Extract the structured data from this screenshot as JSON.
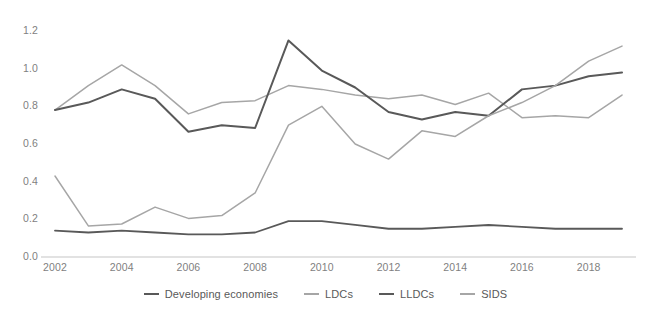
{
  "chart_data": {
    "type": "line",
    "title": "",
    "subtitle": "",
    "xlabel": "",
    "ylabel": "",
    "grid": false,
    "legend_position": "bottom",
    "xlim": [
      2002,
      2019
    ],
    "ylim": [
      0.0,
      1.2
    ],
    "y_ticks": [
      "0.0",
      "0.2",
      "0.4",
      "0.6",
      "0.8",
      "1.0",
      "1.2"
    ],
    "y_tick_values": [
      0.0,
      0.2,
      0.4,
      0.6,
      0.8,
      1.0,
      1.2
    ],
    "x_ticks": [
      "2002",
      "2004",
      "2006",
      "2008",
      "2010",
      "2012",
      "2014",
      "2016",
      "2018"
    ],
    "x_tick_values": [
      2002,
      2004,
      2006,
      2008,
      2010,
      2012,
      2014,
      2016,
      2018
    ],
    "x": [
      2002,
      2003,
      2004,
      2005,
      2006,
      2007,
      2008,
      2009,
      2010,
      2011,
      2012,
      2013,
      2014,
      2015,
      2016,
      2017,
      2018,
      2019
    ],
    "series": [
      {
        "name": "Developing economies",
        "color": "#595959",
        "width": 1.8,
        "values": [
          0.14,
          0.13,
          0.14,
          0.13,
          0.12,
          0.12,
          0.13,
          0.19,
          0.19,
          0.17,
          0.15,
          0.15,
          0.16,
          0.17,
          0.16,
          0.15,
          0.15,
          0.15
        ]
      },
      {
        "name": "LDCs",
        "color": "#a6a6a6",
        "width": 1.5,
        "values": [
          0.78,
          0.91,
          1.02,
          0.91,
          0.76,
          0.82,
          0.83,
          0.91,
          0.89,
          0.86,
          0.84,
          0.86,
          0.81,
          0.87,
          0.74,
          0.75,
          0.74,
          0.86
        ]
      },
      {
        "name": "LLDCs",
        "color": "#595959",
        "width": 2.0,
        "values": [
          0.78,
          0.82,
          0.89,
          0.84,
          0.665,
          0.7,
          0.685,
          1.15,
          0.99,
          0.9,
          0.77,
          0.73,
          0.77,
          0.75,
          0.89,
          0.91,
          0.96,
          0.98
        ]
      },
      {
        "name": "SIDS",
        "color": "#a6a6a6",
        "width": 1.5,
        "values": [
          0.43,
          0.165,
          0.175,
          0.265,
          0.205,
          0.22,
          0.34,
          0.7,
          0.8,
          0.6,
          0.52,
          0.67,
          0.64,
          0.75,
          0.82,
          0.91,
          1.04,
          1.12
        ]
      }
    ]
  },
  "legend": {
    "items": [
      {
        "label": "Developing economies",
        "color": "#595959",
        "width": 2
      },
      {
        "label": "LDCs",
        "color": "#a6a6a6",
        "width": 2
      },
      {
        "label": "LLDCs",
        "color": "#595959",
        "width": 2.5
      },
      {
        "label": "SIDS",
        "color": "#a6a6a6",
        "width": 2
      }
    ]
  },
  "axis": {
    "baseline_color": "#d9d9d9",
    "tick_color": "#7f7f7f"
  }
}
